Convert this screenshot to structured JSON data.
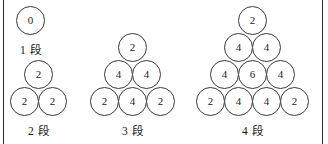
{
  "figure": {
    "background_color": "#ffffff",
    "border_color": "#2b2b2b",
    "circle_outline_color": "#3a3a3a",
    "text_color": "#1e1e1e"
  },
  "groups": [
    {
      "id": "group-1dan",
      "caption": "1 段",
      "tiers": 1,
      "rows": [
        {
          "values": [
            "0"
          ]
        }
      ]
    },
    {
      "id": "group-2dan",
      "caption": "2 段",
      "tiers": 2,
      "rows": [
        {
          "values": [
            "2"
          ]
        },
        {
          "values": [
            "2",
            "2"
          ]
        }
      ]
    },
    {
      "id": "group-3dan",
      "caption": "3 段",
      "tiers": 3,
      "rows": [
        {
          "values": [
            "2"
          ]
        },
        {
          "values": [
            "4",
            "4"
          ]
        },
        {
          "values": [
            "2",
            "4",
            "2"
          ]
        }
      ]
    },
    {
      "id": "group-4dan",
      "caption": "4 段",
      "tiers": 4,
      "rows": [
        {
          "values": [
            "2"
          ]
        },
        {
          "values": [
            "4",
            "4"
          ]
        },
        {
          "values": [
            "4",
            "6",
            "4"
          ]
        },
        {
          "values": [
            "2",
            "4",
            "4",
            "2"
          ]
        }
      ]
    }
  ]
}
